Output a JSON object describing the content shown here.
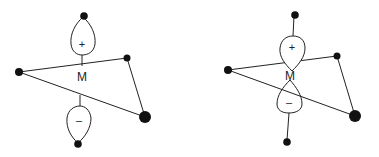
{
  "diagrams": [
    {
      "name": "left",
      "metal_label": "M",
      "upper_lobe_sign": "+",
      "lower_lobe_sign": "–"
    },
    {
      "name": "right",
      "metal_label": "M",
      "upper_lobe_sign": "+",
      "lower_lobe_sign": "–"
    }
  ],
  "colors": {
    "line": "#222222",
    "atom": "#111111",
    "background": "#ffffff"
  }
}
